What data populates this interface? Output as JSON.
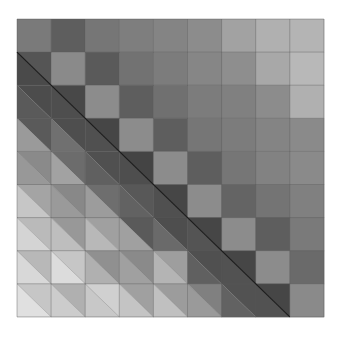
{
  "chart_data": {
    "type": "heatmap",
    "title": "",
    "xlabel": "",
    "ylabel": "",
    "rows": 9,
    "cols": 9,
    "grid": true,
    "legend": "none",
    "upper_and_diagonal": [
      [
        "#7a7a7a",
        "#5e5e5e",
        "#767676",
        "#7e7e7e",
        "#848484",
        "#8c8c8c",
        "#a2a2a2",
        "#b0b0b0",
        "#b4b4b4"
      ],
      [
        null,
        "#8a8a8a",
        "#5a5a5a",
        "#727272",
        "#7c7c7c",
        "#868686",
        "#8e8e8e",
        "#a8a8a8",
        "#b8b8b8"
      ],
      [
        null,
        null,
        "#8c8c8c",
        "#5e5e5e",
        "#707070",
        "#7c7c7c",
        "#808080",
        "#8c8c8c",
        "#b0b0b0"
      ],
      [
        null,
        null,
        null,
        "#8c8c8c",
        "#5e5e5e",
        "#767676",
        "#7c7c7c",
        "#848484",
        "#8a8a8a"
      ],
      [
        null,
        null,
        null,
        null,
        "#8c8c8c",
        "#5e5e5e",
        "#767676",
        "#828282",
        "#8a8a8a"
      ],
      [
        null,
        null,
        null,
        null,
        null,
        "#8c8c8c",
        "#646464",
        "#747474",
        "#808080"
      ],
      [
        null,
        null,
        null,
        null,
        null,
        null,
        "#8c8c8c",
        "#5e5e5e",
        "#7a7a7a"
      ],
      [
        null,
        null,
        null,
        null,
        null,
        null,
        null,
        "#8c8c8c",
        "#6a6a6a"
      ],
      [
        null,
        null,
        null,
        null,
        null,
        null,
        null,
        null,
        "#8a8a8a"
      ]
    ],
    "lower_split": [
      [],
      [
        [
          "#555555",
          "#4a4a4a"
        ]
      ],
      [
        [
          "#4c4c4c",
          "#5a5a5a"
        ],
        [
          "#484848",
          "#4e4e4e"
        ]
      ],
      [
        [
          "#5a5a5a",
          "#9a9a9a"
        ],
        [
          "#4e4e4e",
          "#707070"
        ],
        [
          "#464646",
          "#505050"
        ]
      ],
      [
        [
          "#8a8a8a",
          "#989898"
        ],
        [
          "#6c6c6c",
          "#a2a2a2"
        ],
        [
          "#505050",
          "#606060"
        ],
        [
          "#444444",
          "#4e4e4e"
        ]
      ],
      [
        [
          "#a4a4a4",
          "#c6c6c6"
        ],
        [
          "#888888",
          "#9a9a9a"
        ],
        [
          "#6e6e6e",
          "#9c9c9c"
        ],
        [
          "#585858",
          "#626262"
        ],
        [
          "#464646",
          "#505050"
        ]
      ],
      [
        [
          "#bababa",
          "#d4d4d4"
        ],
        [
          "#989898",
          "#bebebe"
        ],
        [
          "#a0a0a0",
          "#b8b8b8"
        ],
        [
          "#5a5a5a",
          "#a0a0a0"
        ],
        [
          "#4e4e4e",
          "#6a6a6a"
        ],
        [
          "#464646",
          "#545454"
        ]
      ],
      [
        [
          "#b8b8b8",
          "#d8d8d8"
        ],
        [
          "#c6c6c6",
          "#dcdcdc"
        ],
        [
          "#909090",
          "#b0b0b0"
        ],
        [
          "#8a8a8a",
          "#a0a0a0"
        ],
        [
          "#9e9e9e",
          "#b4b4b4"
        ],
        [
          "#505050",
          "#606060"
        ],
        [
          "#464646",
          "#525252"
        ]
      ],
      [
        [
          "#c6c6c6",
          "#e0e0e0"
        ],
        [
          "#b0b0b0",
          "#cccccc"
        ],
        [
          "#d0d0d0",
          "#c8c8c8"
        ],
        [
          "#a0a0a0",
          "#c4c4c4"
        ],
        [
          "#9c9c9c",
          "#c0c0c0"
        ],
        [
          "#808080",
          "#9a9a9a"
        ],
        [
          "#525252",
          "#626262"
        ],
        [
          "#464646",
          "#525252"
        ]
      ]
    ],
    "subdiagonal_line_color": "#1a1a1a",
    "grid_line_color": "#5a5a5a"
  },
  "layout": {
    "left": 17,
    "top": 19,
    "cell_w": 34.1,
    "cell_h": 33.1
  }
}
